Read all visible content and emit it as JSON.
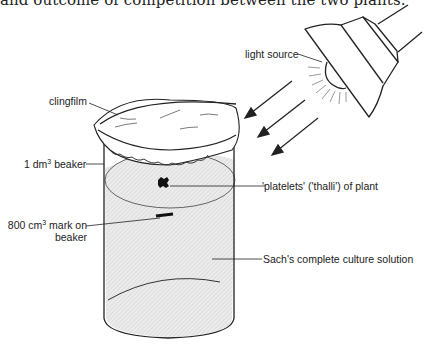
{
  "caption": "and outcome of competition between the two plants.",
  "labels": {
    "light_source": "light source",
    "clingfilm": "clingfilm",
    "beaker_prefix": "1 dm",
    "beaker_sup": "3",
    "beaker_suffix": " beaker",
    "platelets": "'platelets' ('thalli') of plant",
    "mark_prefix": "800 cm",
    "mark_sup": "3",
    "mark_suffix": " mark on",
    "mark_line2": "beaker",
    "solution": "Sach's complete culture solution"
  },
  "colors": {
    "line": "#222222",
    "solution_fill": "#e4e4e4",
    "ray": "#999999"
  }
}
